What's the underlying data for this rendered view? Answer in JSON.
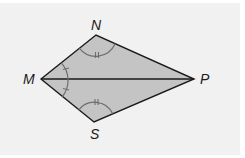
{
  "figure": {
    "type": "kite",
    "vertices": {
      "M": {
        "label": "M",
        "x": 41,
        "y": 79
      },
      "N": {
        "label": "N",
        "x": 96,
        "y": 35
      },
      "P": {
        "label": "P",
        "x": 194,
        "y": 79
      },
      "S": {
        "label": "S",
        "x": 94,
        "y": 122
      }
    },
    "diagonal": [
      "M",
      "P"
    ],
    "angle_marks": [
      {
        "vertex": "N",
        "ticks": 2,
        "description": "angle MNP"
      },
      {
        "vertex": "S",
        "ticks": 2,
        "description": "angle MSP"
      },
      {
        "vertex": "M",
        "ticks": 1,
        "description": "angle NMP"
      },
      {
        "vertex": "M",
        "ticks": 1,
        "description": "angle SMP"
      }
    ],
    "colors": {
      "fill": "#c4c4c4",
      "stroke": "#1a1a1a",
      "arc": "#6e6e6e",
      "background": "#f1f1f1"
    }
  },
  "labels": {
    "M": "M",
    "N": "N",
    "P": "P",
    "S": "S"
  }
}
